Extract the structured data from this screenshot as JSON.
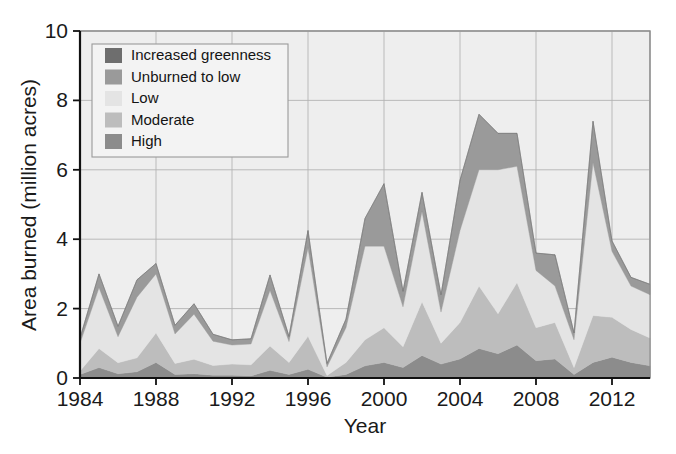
{
  "figure": {
    "kind": "stacked-area-chart",
    "background": "#ffffff"
  },
  "axes": {
    "y_title": "Area burned (million acres)",
    "x_title": "Year",
    "y_ticks": [
      "0",
      "2",
      "4",
      "6",
      "8",
      "10"
    ],
    "x_ticks": [
      "1984",
      "1988",
      "1992",
      "1996",
      "2000",
      "2004",
      "2008",
      "2012"
    ]
  },
  "legend": {
    "items": [
      {
        "label": "Increased greenness",
        "color": "#6e6e6e"
      },
      {
        "label": "Unburned to low",
        "color": "#9a9a9a"
      },
      {
        "label": "Low",
        "color": "#e4e4e4"
      },
      {
        "label": "Moderate",
        "color": "#bdbdbd"
      },
      {
        "label": "High",
        "color": "#8c8c8c"
      }
    ]
  },
  "chart_data": {
    "type": "area",
    "stacked": true,
    "title": "",
    "xlabel": "Year",
    "ylabel": "Area burned (million acres)",
    "xlim": [
      1984,
      2014
    ],
    "ylim": [
      0,
      10
    ],
    "grid": true,
    "legend_position": "upper-left",
    "x": [
      1984,
      1985,
      1986,
      1987,
      1988,
      1989,
      1990,
      1991,
      1992,
      1993,
      1994,
      1995,
      1996,
      1997,
      1998,
      1999,
      2000,
      2001,
      2002,
      2003,
      2004,
      2005,
      2006,
      2007,
      2008,
      2009,
      2010,
      2011,
      2012,
      2013,
      2014
    ],
    "series": [
      {
        "name": "High",
        "color": "#8c8c8c",
        "values": [
          0.1,
          0.3,
          0.12,
          0.18,
          0.45,
          0.1,
          0.12,
          0.08,
          0.08,
          0.06,
          0.22,
          0.1,
          0.25,
          0.02,
          0.1,
          0.35,
          0.45,
          0.3,
          0.65,
          0.4,
          0.55,
          0.85,
          0.7,
          0.95,
          0.5,
          0.55,
          0.1,
          0.45,
          0.6,
          0.45,
          0.35
        ]
      },
      {
        "name": "Moderate",
        "color": "#bdbdbd",
        "values": [
          0.1,
          0.55,
          0.32,
          0.4,
          0.85,
          0.32,
          0.42,
          0.28,
          0.32,
          0.32,
          0.7,
          0.35,
          0.95,
          0.05,
          0.35,
          0.75,
          1.0,
          0.6,
          1.55,
          0.6,
          1.05,
          1.8,
          1.15,
          1.8,
          0.95,
          1.05,
          0.2,
          1.35,
          1.15,
          0.95,
          0.8
        ]
      },
      {
        "name": "Low",
        "color": "#e4e4e4",
        "values": [
          0.8,
          1.75,
          0.75,
          1.75,
          1.7,
          0.85,
          1.3,
          0.7,
          0.55,
          0.6,
          1.6,
          0.6,
          2.55,
          0.25,
          1.0,
          2.7,
          2.35,
          1.15,
          2.6,
          0.9,
          2.65,
          3.35,
          4.15,
          3.35,
          1.65,
          1.05,
          0.8,
          4.4,
          1.9,
          1.25,
          1.25
        ]
      },
      {
        "name": "Unburned to low",
        "color": "#9a9a9a",
        "values": [
          0.15,
          0.4,
          0.3,
          0.5,
          0.3,
          0.25,
          0.3,
          0.2,
          0.15,
          0.15,
          0.45,
          0.15,
          0.5,
          0.1,
          0.25,
          0.8,
          1.8,
          0.45,
          0.55,
          0.5,
          1.45,
          1.6,
          1.05,
          0.95,
          0.5,
          0.9,
          0.2,
          1.2,
          0.3,
          0.25,
          0.3
        ]
      },
      {
        "name": "Increased greenness",
        "color": "#6e6e6e",
        "values": [
          0.0,
          0.0,
          0.0,
          0.0,
          0.0,
          0.0,
          0.0,
          0.0,
          0.0,
          0.0,
          0.0,
          0.0,
          0.0,
          0.0,
          0.0,
          0.0,
          0.0,
          0.0,
          0.0,
          0.0,
          0.0,
          0.0,
          0.0,
          0.0,
          0.0,
          0.0,
          0.0,
          0.0,
          0.0,
          0.0,
          0.0
        ]
      }
    ],
    "totals": [
      1.15,
      3.0,
      1.49,
      2.83,
      3.3,
      1.52,
      2.14,
      1.26,
      1.1,
      1.13,
      2.97,
      1.2,
      4.25,
      0.42,
      1.7,
      4.6,
      5.6,
      2.5,
      5.35,
      2.4,
      5.7,
      7.6,
      7.05,
      7.05,
      3.6,
      3.55,
      1.3,
      7.4,
      3.95,
      2.9,
      2.7
    ]
  }
}
